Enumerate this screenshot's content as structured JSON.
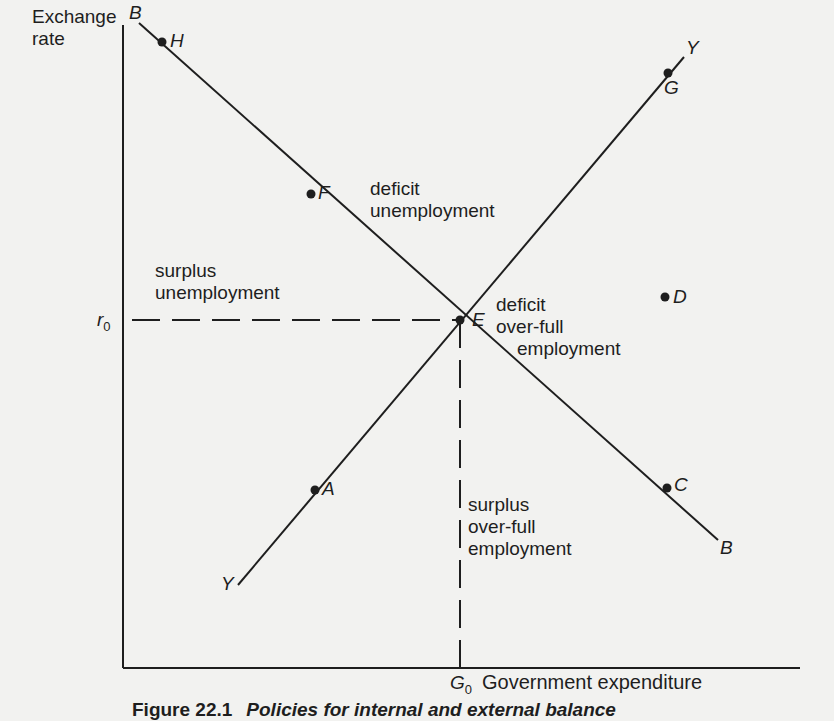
{
  "axes": {
    "y_label_line1": "Exchange",
    "y_label_line2": "rate",
    "x_label": "Government expenditure",
    "y_tick": {
      "symbol": "r",
      "subscript": "0"
    },
    "x_tick": {
      "symbol": "G",
      "subscript": "0"
    }
  },
  "curves": {
    "bb": {
      "start_label": "B",
      "end_label": "B"
    },
    "yy": {
      "start_label": "Y",
      "end_label": "Y"
    }
  },
  "points": {
    "H": "H",
    "F": "F",
    "E": "E",
    "C": "C",
    "A": "A",
    "G": "G",
    "D": "D"
  },
  "regions": {
    "top": {
      "line1": "deficit",
      "line2": "unemployment"
    },
    "left": {
      "line1": "surplus",
      "line2": "unemployment"
    },
    "right": {
      "line1": "deficit",
      "line2": "over-full",
      "line3": "employment"
    },
    "bottom": {
      "line1": "surplus",
      "line2": "over-full",
      "line3": "employment"
    }
  },
  "caption": {
    "number": "Figure 22.1",
    "title": "Policies for internal and external balance"
  },
  "colors": {
    "ink": "#1e1e1e",
    "paper": "#f2f2f0"
  }
}
